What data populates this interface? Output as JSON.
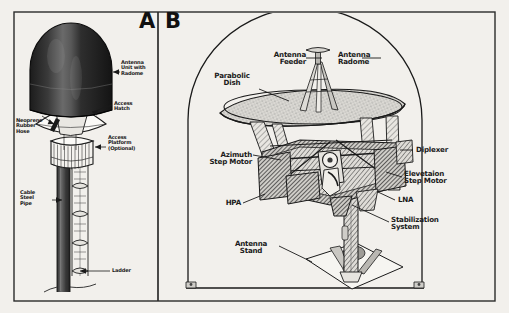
{
  "figure": {
    "background_color": "#f2f0ec",
    "ink_color": "#1a1a1a",
    "panels": [
      {
        "letter": "A",
        "name": "antenna-mast-assembly",
        "labels": [
          {
            "id": "antenna-unit-with-radome",
            "text": "Antenna\nUnit with\nRadome"
          },
          {
            "id": "access-hatch",
            "text": "Access\nHatch"
          },
          {
            "id": "neoprene-rubber-hose",
            "text": "Neoprene\nRubber\nHose"
          },
          {
            "id": "access-platform-optional",
            "text": "Access\nPlatform\n(Optional)"
          },
          {
            "id": "cable-steel-pipe",
            "text": "Cable\nSteel\nPipe"
          },
          {
            "id": "ladder",
            "text": "Ladder"
          }
        ]
      },
      {
        "letter": "B",
        "name": "antenna-internal-assembly",
        "labels": [
          {
            "id": "antenna-feeder",
            "text": "Antenna\nFeeder"
          },
          {
            "id": "antenna-radome",
            "text": "Antenna\nRadome"
          },
          {
            "id": "parabolic-dish",
            "text": "Parabolic\nDish"
          },
          {
            "id": "diplexer",
            "text": "Diplexer"
          },
          {
            "id": "azimuth-step-motor",
            "text": "Azimuth\nStep Motor"
          },
          {
            "id": "elevetaion-step-motor",
            "text": "Elevetaion\nStep Motor"
          },
          {
            "id": "hpa",
            "text": "HPA"
          },
          {
            "id": "lna",
            "text": "LNA"
          },
          {
            "id": "stabilization-system",
            "text": "Stabilization\nSystem"
          },
          {
            "id": "antenna-stand",
            "text": "Antenna\nStand"
          }
        ]
      }
    ]
  }
}
